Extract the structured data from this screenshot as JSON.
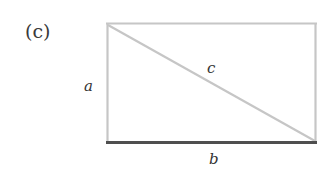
{
  "figure": {
    "panel_label": "(c)",
    "labels": {
      "a": "a",
      "b": "b",
      "c": "c"
    },
    "colors": {
      "light_edge": "#c6c6c6",
      "base_edge": "#4f4f4f",
      "text": "#333333",
      "background": "#ffffff"
    },
    "rectangle": {
      "x": 107,
      "y": 23,
      "width": 209,
      "height": 120
    }
  }
}
